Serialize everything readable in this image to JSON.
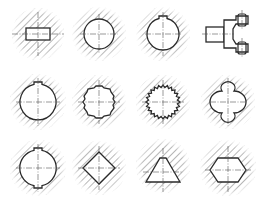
{
  "diagram": {
    "type": "shaft-hub-connection-cross-sections",
    "layout": {
      "rows": 3,
      "cols": 4
    },
    "colors": {
      "line": "#2a2a2a",
      "hatch": "#7a7a7a",
      "background": "#ffffff"
    },
    "figures": [
      {
        "row": 1,
        "col": 1,
        "shape": "rectangular-key-section",
        "cx": 38,
        "cy": 34
      },
      {
        "row": 1,
        "col": 2,
        "shape": "plain-round-shaft",
        "cx": 99,
        "cy": 34
      },
      {
        "row": 1,
        "col": 3,
        "shape": "round-shaft-with-keyway",
        "cx": 163,
        "cy": 34
      },
      {
        "row": 1,
        "col": 4,
        "shape": "fork-clevis-side-view",
        "cx": 228,
        "cy": 34
      },
      {
        "row": 2,
        "col": 1,
        "shape": "round-shaft-with-single-key",
        "cx": 38,
        "cy": 102
      },
      {
        "row": 2,
        "col": 2,
        "shape": "straight-sided-spline",
        "cx": 99,
        "cy": 102
      },
      {
        "row": 2,
        "col": 3,
        "shape": "serrated-spline",
        "cx": 163,
        "cy": 102
      },
      {
        "row": 2,
        "col": 4,
        "shape": "lobed-profile",
        "cx": 228,
        "cy": 102
      },
      {
        "row": 3,
        "col": 1,
        "shape": "round-shaft-with-two-keys",
        "cx": 38,
        "cy": 168
      },
      {
        "row": 3,
        "col": 2,
        "shape": "square-profile",
        "cx": 99,
        "cy": 168
      },
      {
        "row": 3,
        "col": 3,
        "shape": "triangular-profile",
        "cx": 163,
        "cy": 168
      },
      {
        "row": 3,
        "col": 4,
        "shape": "hexagonal-profile",
        "cx": 228,
        "cy": 168
      }
    ]
  }
}
